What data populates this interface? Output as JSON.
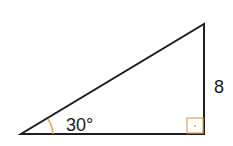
{
  "diagram": {
    "type": "right-triangle",
    "angle_label": "30°",
    "side_label": "8",
    "right_angle_marker": true,
    "colors": {
      "stroke": "#1f1f1f",
      "angle_marker": "#e8a25a",
      "background": "#ffffff"
    }
  }
}
